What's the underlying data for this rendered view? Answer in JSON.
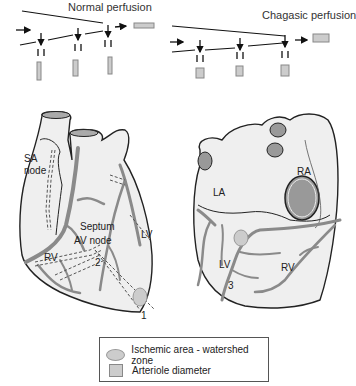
{
  "perfusion": {
    "normal_title": "Normal perfusion",
    "chagasic_title": "Chagasic perfusion"
  },
  "left_heart": {
    "labels": {
      "sa_node_1": "SA",
      "sa_node_2": "node",
      "septum": "Septum",
      "av_node": "AV node",
      "rv": "RV",
      "lv": "LV",
      "marker_1": "1",
      "marker_2": "2"
    }
  },
  "right_heart": {
    "labels": {
      "la": "LA",
      "ra": "RA",
      "lv": "LV",
      "rv": "RV",
      "marker_3": "3"
    }
  },
  "legend": {
    "items": [
      {
        "icon": "ellipse-swatch",
        "label": "Ischemic area - watershed zone"
      },
      {
        "icon": "square-swatch",
        "label": "Arteriole diameter"
      }
    ]
  },
  "colors": {
    "vessel": "#8a8a8a",
    "heart_fill": "#efefef",
    "ischemic": "#cccccc",
    "outline": "#222222"
  }
}
